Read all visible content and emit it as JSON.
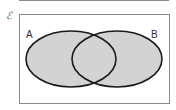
{
  "diagram": {
    "type": "venn",
    "universal_set_symbol": "ℰ",
    "sets": [
      {
        "label": "A",
        "cx": 71,
        "cy": 59,
        "rx": 45,
        "ry": 28
      },
      {
        "label": "B",
        "cx": 117,
        "cy": 59,
        "rx": 45,
        "ry": 28
      }
    ],
    "shaded_region": "A ∪ B",
    "colors": {
      "fill": "#d3d3d3",
      "stroke": "#1a1a1a",
      "frame": "#8a8a8a"
    }
  }
}
